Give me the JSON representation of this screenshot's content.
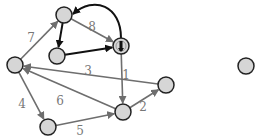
{
  "diagram": {
    "type": "directed-weighted-graph",
    "colors": {
      "node_fill": "#d6d6d6",
      "node_stroke": "#222222",
      "edge_gray": "#6e6e6e",
      "edge_black": "#111111",
      "label": "#777777"
    },
    "nodes": [
      {
        "id": "top",
        "x": 64,
        "y": 15
      },
      {
        "id": "mid",
        "x": 57,
        "y": 56
      },
      {
        "id": "source",
        "x": 121,
        "y": 46,
        "marker": "cursor-icon"
      },
      {
        "id": "left",
        "x": 15,
        "y": 65
      },
      {
        "id": "bottom_left",
        "x": 48,
        "y": 127
      },
      {
        "id": "bottom_right",
        "x": 123,
        "y": 112
      },
      {
        "id": "right",
        "x": 166,
        "y": 85
      },
      {
        "id": "far_right",
        "x": 246,
        "y": 66
      }
    ],
    "edges": [
      {
        "from": "left",
        "to": "top",
        "weight": "7",
        "style": "gray"
      },
      {
        "from": "top",
        "to": "source",
        "weight": "8",
        "style": "gray"
      },
      {
        "from": "source",
        "to": "top",
        "weight": "",
        "style": "black-curved"
      },
      {
        "from": "top",
        "to": "mid",
        "weight": "",
        "style": "black"
      },
      {
        "from": "mid",
        "to": "source",
        "weight": "",
        "style": "black"
      },
      {
        "from": "right",
        "to": "left",
        "weight": "3",
        "style": "gray"
      },
      {
        "from": "source",
        "to": "bottom_right",
        "weight": "1",
        "style": "gray"
      },
      {
        "from": "left",
        "to": "bottom_left",
        "weight": "4",
        "style": "gray"
      },
      {
        "from": "bottom_right",
        "to": "left",
        "weight": "6",
        "style": "gray"
      },
      {
        "from": "bottom_left",
        "to": "bottom_right",
        "weight": "5",
        "style": "gray"
      },
      {
        "from": "bottom_right",
        "to": "right",
        "weight": "2",
        "style": "gray"
      }
    ],
    "labels": [
      {
        "text": "7",
        "x": 31,
        "y": 38
      },
      {
        "text": "8",
        "x": 92,
        "y": 27
      },
      {
        "text": "3",
        "x": 88,
        "y": 71
      },
      {
        "text": "1",
        "x": 126,
        "y": 75
      },
      {
        "text": "4",
        "x": 22,
        "y": 104
      },
      {
        "text": "6",
        "x": 60,
        "y": 101
      },
      {
        "text": "5",
        "x": 80,
        "y": 131
      },
      {
        "text": "2",
        "x": 143,
        "y": 107
      }
    ]
  }
}
